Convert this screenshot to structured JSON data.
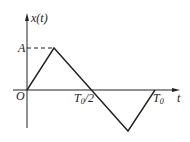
{
  "diagram": {
    "type": "triangular waveform",
    "y_axis_label": "x(t)",
    "x_axis_label": "t",
    "origin_label": "O",
    "amplitude_label": "A",
    "half_period_label": {
      "base": "T",
      "sub": "0",
      "suffix": "/2"
    },
    "period_label": {
      "base": "T",
      "sub": "0"
    },
    "stroke_color": "#222222"
  }
}
